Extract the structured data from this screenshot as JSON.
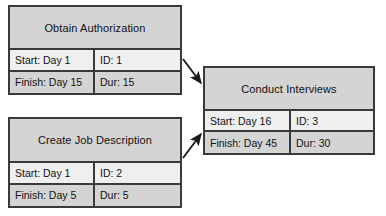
{
  "diagram": {
    "type": "pert-network",
    "colors": {
      "node_fill_header": "#d4d4d4",
      "node_fill_start_row": "#efefef",
      "node_fill_finish_row": "#d4d4d4",
      "border": "#3a3a3a",
      "arrow": "#1a1a1a",
      "background": "#ffffff",
      "text": "#111111"
    },
    "nodes": [
      {
        "id": "obtain-authorization",
        "name": "Obtain Authorization",
        "start": "Start: Day 1",
        "task_id": "ID: 1",
        "finish": "Finish: Day 15",
        "duration": "Dur: 15",
        "geometry": {
          "x": 8,
          "y": 5,
          "w": 174,
          "h": 90,
          "header_h": 43,
          "col_split": 85
        }
      },
      {
        "id": "create-job-description",
        "name": "Create Job Description",
        "start": "Start: Day 1",
        "task_id": "ID: 2",
        "finish": "Finish: Day 5",
        "duration": "Dur: 5",
        "geometry": {
          "x": 8,
          "y": 117,
          "w": 174,
          "h": 91,
          "header_h": 44,
          "col_split": 85
        }
      },
      {
        "id": "conduct-interviews",
        "name": "Conduct Interviews",
        "start": "Start: Day 16",
        "task_id": "ID: 3",
        "finish": "Finish: Day 45",
        "duration": "Dur: 30",
        "geometry": {
          "x": 203,
          "y": 66,
          "w": 172,
          "h": 89,
          "header_h": 43,
          "col_split": 86
        }
      }
    ],
    "connectors": [
      {
        "id": "arrow-auth-to-interviews",
        "from": "obtain-authorization",
        "to": "conduct-interviews",
        "x1": 183,
        "y1": 59,
        "x2": 201,
        "y2": 83
      },
      {
        "id": "arrow-jobdesc-to-interviews",
        "from": "create-job-description",
        "to": "conduct-interviews",
        "x1": 183,
        "y1": 158,
        "x2": 201,
        "y2": 134
      }
    ]
  }
}
